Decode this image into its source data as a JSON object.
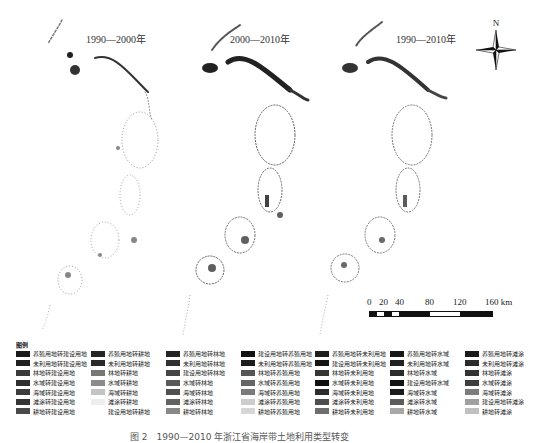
{
  "panels": [
    {
      "title": "1990—2000年",
      "x": 0,
      "density": 0.55
    },
    {
      "title": "2000—2010年",
      "x": 150,
      "density": 0.85
    },
    {
      "title": "1990—2010年",
      "x": 300,
      "density": 0.8
    }
  ],
  "north_arrow": {
    "label": "N"
  },
  "scale_bar": {
    "labels": [
      "0",
      "20",
      "40",
      "80",
      "120",
      "160 km"
    ]
  },
  "legend": {
    "title": "图例",
    "columns": [
      [
        {
          "label": "养殖用地转建设用地",
          "color": "#1a1a1a"
        },
        {
          "label": "未利用地转建设用地",
          "color": "#202020"
        },
        {
          "label": "林地转建设用地",
          "color": "#3a3a3a"
        },
        {
          "label": "水域转建设用地",
          "color": "#2e2e2e"
        },
        {
          "label": "海域转建设用地",
          "color": "#3c3c3c"
        },
        {
          "label": "滩涂转建设用地",
          "color": "#353535"
        },
        {
          "label": "耕地转建设用地",
          "color": "#4a4a4a"
        }
      ],
      [
        {
          "label": "养殖用地转耕地",
          "color": "#262626"
        },
        {
          "label": "未利用地转耕地",
          "color": "#2a2a2a"
        },
        {
          "label": "林地转耕地",
          "color": "#777777"
        },
        {
          "label": "水域转耕地",
          "color": "#8a8a8a"
        },
        {
          "label": "海域转耕地",
          "color": "#c4c4c4"
        },
        {
          "label": "滩涂转耕地",
          "color": "#eeeeee"
        },
        {
          "label": "建设用地转耕地",
          "color": "#ffffff"
        }
      ],
      [
        {
          "label": "养殖用地转林地",
          "color": "#242424"
        },
        {
          "label": "未利用地转林地",
          "color": "#303030"
        },
        {
          "label": "建设用地转林地",
          "color": "#444444"
        },
        {
          "label": "水域转林地",
          "color": "#5a5a5a"
        },
        {
          "label": "海域转林地",
          "color": "#505050"
        },
        {
          "label": "滩涂转林地",
          "color": "#626262"
        },
        {
          "label": "耕地转林地",
          "color": "#888888"
        }
      ],
      [
        {
          "label": "建设用地转养殖用地",
          "color": "#111111"
        },
        {
          "label": "未利用地转养殖用地",
          "color": "#1c1c1c"
        },
        {
          "label": "林地转养殖用地",
          "color": "#555555"
        },
        {
          "label": "水域转养殖用地",
          "color": "#666666"
        },
        {
          "label": "海域转养殖用地",
          "color": "#7a7a7a"
        },
        {
          "label": "滩涂转养殖用地",
          "color": "#cccccc"
        },
        {
          "label": "耕地转养殖用地",
          "color": "#d6d6d6"
        }
      ],
      [
        {
          "label": "养殖用地转未利用地",
          "color": "#1e1e1e"
        },
        {
          "label": "建设用地转未利用地",
          "color": "#151515"
        },
        {
          "label": "林地转未利用地",
          "color": "#363636"
        },
        {
          "label": "水域转未利用地",
          "color": "#101010"
        },
        {
          "label": "海域转未利用地",
          "color": "#2c2c2c"
        },
        {
          "label": "滩涂转未利用地",
          "color": "#4e4e4e"
        },
        {
          "label": "耕地转未利用地",
          "color": "#6e6e6e"
        }
      ],
      [
        {
          "label": "养殖用地转水域",
          "color": "#181818"
        },
        {
          "label": "未利用地转水域",
          "color": "#222222"
        },
        {
          "label": "林地转水域",
          "color": "#2c2c2c"
        },
        {
          "label": "建设用地转水域",
          "color": "#141414"
        },
        {
          "label": "海域转水域",
          "color": "#1a1a1a"
        },
        {
          "label": "滩涂转水域",
          "color": "#5c5c5c"
        },
        {
          "label": "耕地转水域",
          "color": "#a8a8a8"
        }
      ],
      [
        {
          "label": "养殖用地转滩涂",
          "color": "#1a1a1a"
        },
        {
          "label": "未利用地转滩涂",
          "color": "#2a2a2a"
        },
        {
          "label": "林地转滩涂",
          "color": "#333333"
        },
        {
          "label": "水域转滩涂",
          "color": "#3e3e3e"
        },
        {
          "label": "海域转滩涂",
          "color": "#7c7c7c"
        },
        {
          "label": "建设用地转滩涂",
          "color": "#a0a0a0"
        },
        {
          "label": "耕地转滩涂",
          "color": "#c0c0c0"
        }
      ]
    ]
  },
  "caption": "图 2　1990—2010 年浙江省海岸带土地利用类型转变"
}
